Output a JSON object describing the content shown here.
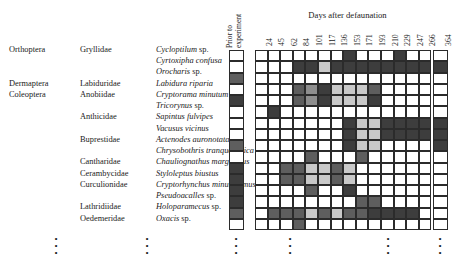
{
  "figure": {
    "header_prior_line1": "Prior to",
    "header_prior_line2": "experiment",
    "header_days_title": "Days after defaunation",
    "day_labels": [
      "24",
      "45",
      "62",
      "84",
      "101",
      "117",
      "136",
      "153",
      "171",
      "193",
      "210",
      "229",
      "247",
      "266",
      "364"
    ],
    "ellipsis": "•"
  },
  "rows": [
    {
      "order": "Orthoptera",
      "family": "Gryllidae",
      "genus": "Cycloptilum",
      "epithet": "sp.",
      "italic_epithet": false
    },
    {
      "order": "",
      "family": "",
      "genus": "Cyrtoxipha",
      "epithet": "confusa",
      "italic_epithet": true
    },
    {
      "order": "",
      "family": "",
      "genus": "Orocharis",
      "epithet": "sp.",
      "italic_epithet": false
    },
    {
      "order": "Dermaptera",
      "family": "Labiduridae",
      "genus": "Labidura",
      "epithet": "riparia",
      "italic_epithet": true
    },
    {
      "order": "Coleoptera",
      "family": "Anobiidae",
      "genus": "Cryptorama",
      "epithet": "minutum",
      "italic_epithet": true
    },
    {
      "order": "",
      "family": "",
      "genus": "Tricorynus",
      "epithet": "sp.",
      "italic_epithet": false
    },
    {
      "order": "",
      "family": "Anthicidae",
      "genus": "Sapintus",
      "epithet": "fulvipes",
      "italic_epithet": true
    },
    {
      "order": "",
      "family": "",
      "genus": "Vacusus",
      "epithet": "vicinus",
      "italic_epithet": true
    },
    {
      "order": "",
      "family": "Buprestidae",
      "genus": "Actenodes",
      "epithet": "auronotata",
      "italic_epithet": true
    },
    {
      "order": "",
      "family": "",
      "genus": "Chrysobothris",
      "epithet": "tranquebarica",
      "italic_epithet": true
    },
    {
      "order": "",
      "family": "Cantharidae",
      "genus": "Chauliognathus",
      "epithet": "marginatus",
      "italic_epithet": true
    },
    {
      "order": "",
      "family": "Cerambycidae",
      "genus": "Styloleptus",
      "epithet": "biustus",
      "italic_epithet": true
    },
    {
      "order": "",
      "family": "Curculionidae",
      "genus": "Cryptorhynchus",
      "epithet": "minutissimus",
      "italic_epithet": true
    },
    {
      "order": "",
      "family": "",
      "genus": "Pseudoacalles",
      "epithet": "sp.",
      "italic_epithet": false
    },
    {
      "order": "",
      "family": "Lathridiidae",
      "genus": "Holoparamecus",
      "epithet": "sp.",
      "italic_epithet": false
    },
    {
      "order": "",
      "family": "Oedemeridae",
      "genus": "Oxacis",
      "epithet": "sp.",
      "italic_epithet": false
    }
  ],
  "chart_data": {
    "type": "heatmap",
    "title": "Days after defaunation",
    "xlabel": "",
    "ylabel": "",
    "grid": true,
    "legend_position": "none",
    "shade_scale": {
      "0": "#ffffff",
      "1": "#c9c9c9",
      "2": "#8e8e8e",
      "3": "#5e5e5e",
      "4": "#3d3d3d"
    },
    "prior_column_label": "Prior to experiment",
    "x_categories": [
      "24",
      "45",
      "62",
      "84",
      "101",
      "117",
      "136",
      "153",
      "171",
      "193",
      "210",
      "229",
      "247",
      "266",
      "364"
    ],
    "y_categories": [
      "Cycloptilum sp.",
      "Cyrtoxipha confusa",
      "Orocharis sp.",
      "Labidura riparia",
      "Cryptorama minutum",
      "Tricorynus sp.",
      "Sapintus fulvipes",
      "Vacusus vicinus",
      "Actenodes auronotata",
      "Chrysobothris tranquebarica",
      "Chauliognathus marginatus",
      "Styloleptus biustus",
      "Cryptorhynchus minutissimus",
      "Pseudoacalles sp.",
      "Holoparamecus sp.",
      "Oxacis sp."
    ],
    "prior_values": [
      0,
      0,
      3,
      0,
      4,
      0,
      0,
      0,
      3,
      0,
      4,
      4,
      4,
      4,
      3,
      0
    ],
    "values": [
      [
        0,
        0,
        0,
        0,
        0,
        0,
        0,
        4,
        0,
        0,
        0,
        4,
        0,
        0
      ],
      [
        0,
        0,
        0,
        4,
        4,
        1,
        4,
        4,
        4,
        4,
        4,
        4,
        4,
        4
      ],
      [
        0,
        0,
        0,
        0,
        0,
        0,
        0,
        0,
        0,
        0,
        0,
        0,
        0,
        0
      ],
      [
        0,
        0,
        0,
        3,
        2,
        4,
        1,
        1,
        1,
        3,
        0,
        0,
        0,
        0
      ],
      [
        0,
        0,
        0,
        3,
        2,
        4,
        1,
        1,
        1,
        4,
        0,
        0,
        0,
        0
      ],
      [
        0,
        4,
        0,
        0,
        0,
        0,
        0,
        0,
        0,
        0,
        0,
        0,
        0,
        0
      ],
      [
        0,
        0,
        0,
        0,
        0,
        0,
        0,
        4,
        1,
        1,
        4,
        4,
        4,
        4
      ],
      [
        0,
        0,
        0,
        0,
        0,
        0,
        0,
        4,
        1,
        1,
        4,
        4,
        4,
        4
      ],
      [
        0,
        0,
        0,
        0,
        0,
        0,
        0,
        4,
        1,
        1,
        0,
        0,
        0,
        0
      ],
      [
        0,
        0,
        0,
        0,
        3,
        0,
        0,
        0,
        3,
        0,
        0,
        0,
        0,
        0
      ],
      [
        0,
        0,
        3,
        3,
        1,
        1,
        3,
        1,
        0,
        0,
        0,
        0,
        0,
        0
      ],
      [
        0,
        0,
        3,
        3,
        1,
        1,
        3,
        1,
        0,
        0,
        0,
        0,
        0,
        0
      ],
      [
        0,
        0,
        0,
        0,
        3,
        0,
        0,
        4,
        0,
        0,
        0,
        0,
        0,
        0
      ],
      [
        0,
        0,
        0,
        0,
        0,
        0,
        0,
        0,
        3,
        3,
        0,
        0,
        0,
        0
      ],
      [
        0,
        3,
        3,
        3,
        1,
        3,
        1,
        3,
        3,
        4,
        4,
        4,
        4,
        0
      ],
      [
        0,
        0,
        0,
        3,
        0,
        0,
        0,
        0,
        0,
        0,
        0,
        0,
        0,
        0
      ]
    ],
    "last_column_values": [
      0,
      4,
      0,
      0,
      0,
      0,
      4,
      4,
      4,
      0,
      0,
      0,
      0,
      0,
      0,
      0
    ]
  }
}
